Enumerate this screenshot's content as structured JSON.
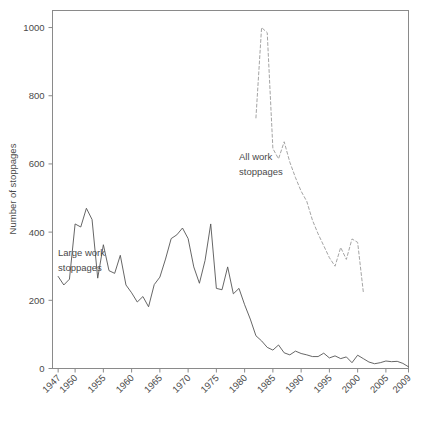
{
  "chart_data": {
    "type": "line",
    "title": "",
    "xlabel": "",
    "ylabel": "Number of stoppages",
    "xlim": [
      1946,
      2009
    ],
    "ylim": [
      0,
      1050
    ],
    "yticks": [
      0,
      200,
      400,
      600,
      800,
      1000
    ],
    "xticks": [
      1947,
      1950,
      1955,
      1960,
      1965,
      1970,
      1975,
      1980,
      1985,
      1990,
      1995,
      2000,
      2005,
      2009
    ],
    "grid": false,
    "legend_position": "inline-annotations",
    "series": [
      {
        "name": "Large work stoppages",
        "style": "solid",
        "color": "#555555",
        "x": [
          1947,
          1948,
          1949,
          1950,
          1951,
          1952,
          1953,
          1954,
          1955,
          1956,
          1957,
          1958,
          1959,
          1960,
          1961,
          1962,
          1963,
          1964,
          1965,
          1966,
          1967,
          1968,
          1969,
          1970,
          1971,
          1972,
          1973,
          1974,
          1975,
          1976,
          1977,
          1978,
          1979,
          1980,
          1981,
          1982,
          1983,
          1984,
          1985,
          1986,
          1987,
          1988,
          1989,
          1990,
          1991,
          1992,
          1993,
          1994,
          1995,
          1996,
          1997,
          1998,
          1999,
          2000,
          2001,
          2002,
          2003,
          2004,
          2005,
          2006,
          2007,
          2008,
          2009
        ],
        "values": [
          270,
          245,
          262,
          424,
          415,
          470,
          437,
          265,
          363,
          287,
          279,
          332,
          245,
          222,
          195,
          211,
          181,
          246,
          268,
          321,
          381,
          392,
          412,
          381,
          298,
          250,
          317,
          424,
          235,
          231,
          298,
          219,
          235,
          187,
          145,
          96,
          81,
          62,
          54,
          69,
          46,
          40,
          51,
          44,
          40,
          35,
          35,
          45,
          31,
          37,
          29,
          34,
          17,
          39,
          29,
          19,
          14,
          17,
          22,
          20,
          21,
          15,
          5
        ]
      },
      {
        "name": "All work stoppages",
        "style": "dashed",
        "color": "#9a9a9a",
        "x": [
          1982,
          1983,
          1984,
          1985,
          1986,
          1987,
          1988,
          1989,
          1990,
          1991,
          1992,
          1993,
          1994,
          1995,
          1996,
          1997,
          1998,
          1999,
          2000,
          2001
        ],
        "values": [
          735,
          1000,
          985,
          645,
          615,
          665,
          605,
          560,
          520,
          490,
          435,
          395,
          360,
          325,
          300,
          355,
          320,
          380,
          370,
          225
        ]
      }
    ],
    "annotations": [
      {
        "text_line1": "Large work",
        "text_line2": "stoppages",
        "x_px": 58,
        "y_px": 248
      },
      {
        "text_line1": "All work",
        "text_line2": "stoppages",
        "x_px": 239,
        "y_px": 151
      }
    ]
  },
  "axis": {
    "ylabel": "Number of stoppages",
    "ytick_labels": [
      "0",
      "200",
      "400",
      "600",
      "800",
      "1000"
    ],
    "xtick_labels": [
      "1947",
      "1950",
      "1955",
      "1960",
      "1965",
      "1970",
      "1975",
      "1980",
      "1985",
      "1990",
      "1995",
      "2000",
      "2005",
      "2009"
    ]
  },
  "colors": {
    "frame": "#8a8a8a",
    "solid_series": "#555555",
    "dashed_series": "#a0a0a0",
    "text": "#4a4a4a",
    "background": "#ffffff"
  }
}
